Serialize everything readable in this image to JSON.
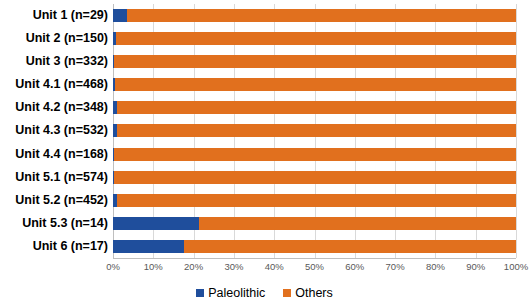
{
  "chart_data": {
    "type": "bar",
    "orientation": "horizontal",
    "stacked": true,
    "normalized": true,
    "title": "",
    "xlabel": "",
    "ylabel": "",
    "xlim": [
      0,
      100
    ],
    "xticks": [
      "0%",
      "10%",
      "20%",
      "30%",
      "40%",
      "50%",
      "60%",
      "70%",
      "80%",
      "90%",
      "100%"
    ],
    "xtick_values": [
      0,
      10,
      20,
      30,
      40,
      50,
      60,
      70,
      80,
      90,
      100
    ],
    "grid": "vertical",
    "legend_position": "bottom",
    "categories": [
      "Unit 1 (n=29)",
      "Unit 2 (n=150)",
      "Unit 3 (n=332)",
      "Unit 4.1 (n=468)",
      "Unit 4.2 (n=348)",
      "Unit 4.3 (n=532)",
      "Unit 4.4 (n=168)",
      "Unit 5.1 (n=574)",
      "Unit 5.2 (n=452)",
      "Unit 5.3 (n=14)",
      "Unit 6 (n=17)"
    ],
    "series": [
      {
        "name": "Paleolithic",
        "color": "#1f4e9c",
        "values": [
          3.4,
          0.7,
          0.3,
          0.6,
          1.1,
          1.1,
          0.2,
          0.2,
          1.1,
          21.4,
          17.6
        ]
      },
      {
        "name": "Others",
        "color": "#e1701e",
        "values": [
          96.6,
          99.3,
          99.7,
          99.4,
          98.9,
          98.9,
          99.8,
          99.8,
          98.9,
          78.6,
          82.4
        ]
      }
    ]
  },
  "legend": {
    "items": [
      {
        "label": "Paleolithic",
        "color": "#1f4e9c"
      },
      {
        "label": "Others",
        "color": "#e1701e"
      }
    ]
  }
}
